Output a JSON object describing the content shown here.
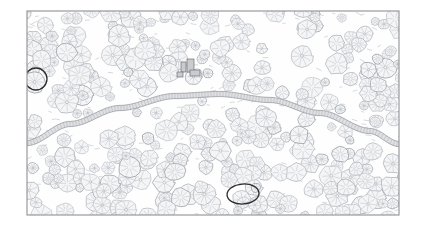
{
  "document": {
    "type": "site-plan-drawing",
    "title": "Forest Site Plan",
    "medium": "line-drawing",
    "canvas": {
      "width": 426,
      "height": 228
    },
    "background_color": "#ffffff"
  },
  "frame": {
    "name": "drawing-border",
    "x": 27,
    "y": 11,
    "width": 372,
    "height": 204,
    "stroke_color": "#8f9094",
    "stroke_width": 1.1,
    "inner_fill": "#fefefe"
  },
  "palette": {
    "canopy_stroke": "#b9bcc2",
    "canopy_fill": "#f4f5f6",
    "canopy_stroke_dark": "#a4a8af",
    "spoke_stroke": "#c5c8ce",
    "shrub_stroke": "#c9ccd2",
    "road_stroke": "#9a9ca1",
    "road_fill": "#dfe0e3",
    "road_hatch": "#b0b2b7",
    "annotation_stroke": "#2a2b2e",
    "structure_stroke": "#6f7176",
    "structure_fill": "#c9cbcf",
    "ground_tint": "#fbfbfc"
  },
  "road": {
    "name": "curved-road",
    "description": "Gently arcing road crossing the plan from lower-left to lower-right, cresting near the upper-middle",
    "band_width": 5.2,
    "hatch_spacing": 3.0,
    "path_points": [
      [
        27,
        143
      ],
      [
        70,
        124
      ],
      [
        120,
        108
      ],
      [
        175,
        96
      ],
      [
        220,
        94
      ],
      [
        270,
        100
      ],
      [
        320,
        113
      ],
      [
        370,
        131
      ],
      [
        399,
        144
      ]
    ]
  },
  "structures": [
    {
      "name": "structure-a",
      "x": 181,
      "y": 62,
      "w": 5,
      "h": 10,
      "label": ""
    },
    {
      "name": "structure-b",
      "x": 187,
      "y": 59,
      "w": 7,
      "h": 13,
      "label": ""
    },
    {
      "name": "structure-c",
      "x": 190,
      "y": 70,
      "w": 10,
      "h": 6,
      "label": ""
    },
    {
      "name": "structure-d",
      "x": 177,
      "y": 72,
      "w": 6,
      "h": 5,
      "label": ""
    }
  ],
  "annotations": [
    {
      "name": "annotation-circle-left",
      "shape": "circle",
      "cx": 36,
      "cy": 79,
      "rx": 11,
      "ry": 11,
      "rotation": 0,
      "stroke_color": "#2a2b2e",
      "stroke_width": 1.3
    },
    {
      "name": "annotation-ellipse-bottom",
      "shape": "ellipse",
      "cx": 243,
      "cy": 194,
      "rx": 16,
      "ry": 10,
      "rotation": -4,
      "stroke_color": "#2a2b2e",
      "stroke_width": 1.3
    }
  ],
  "clearing": {
    "name": "open-clearing",
    "description": "Low-density open area in the upper-right quadrant of the plan",
    "cx": 300,
    "cy": 62,
    "rx": 48,
    "ry": 32
  },
  "canopy": {
    "name": "tree-canopy-layer",
    "symbol": "radial-spoke-circle",
    "count": 300,
    "radius_min": 4.2,
    "radius_max": 11.5,
    "spokes_min": 6,
    "spokes_max": 11
  },
  "shrubs": {
    "name": "shrub-dash-layer",
    "symbol": "short-dash",
    "count": 240,
    "length_min": 2.0,
    "length_max": 5.5
  },
  "legend": {
    "visible": false,
    "items": []
  },
  "scale_bar": {
    "visible": false,
    "label": ""
  }
}
